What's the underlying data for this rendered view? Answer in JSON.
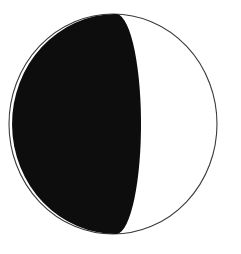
{
  "figure": {
    "type": "moon-phase-diagram",
    "title": "",
    "caption": "",
    "background_color": "#ffffff",
    "canvas": {
      "width": 241,
      "height": 254
    }
  },
  "disc": {
    "name": "moon-disc",
    "center_x": 113,
    "center_y": 124,
    "radius": 110,
    "radius_x": 104,
    "radius_y": 110,
    "fill_color": "#ffffff",
    "outline_color": "#3a3a3a",
    "outline_width": 1.1
  },
  "shadow": {
    "name": "shadowed-region",
    "fill_color": "#0d0d0d",
    "description": "dark shadowed portion covering the left side of the disc",
    "top_vertex_x": 115,
    "top_vertex_y": 14,
    "bottom_vertex_x": 117,
    "bottom_vertex_y": 234,
    "terminator_max_x": 139,
    "terminator_mid_y": 124,
    "terminator_rx": 25,
    "terminator_ry": 110,
    "illuminated_side": "right",
    "illuminated_fraction": 0.38
  },
  "labels": {
    "alt_text": "Circle with the left portion filled solid black and the right portion white, divided by a curved terminator",
    "shadow_label": "shadow",
    "light_label": "illuminated"
  }
}
